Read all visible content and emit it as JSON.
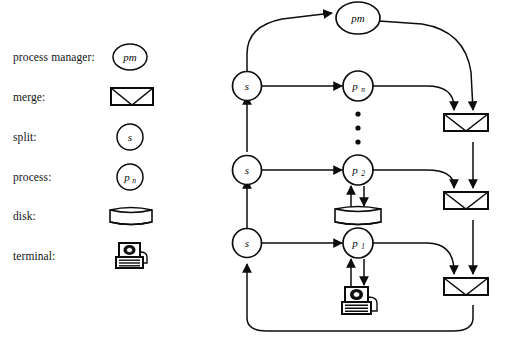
{
  "figure": {
    "kind": "process-pipeline-diagram",
    "background_color": "#ffffff",
    "line_color": "#0d0d0d"
  },
  "legend": {
    "title": "",
    "items": [
      {
        "label": "process manager:",
        "symbol": "pm-oval",
        "symbol_text": "pm",
        "y": 57
      },
      {
        "label": "merge:",
        "symbol": "merge-box",
        "symbol_text": "",
        "y": 97
      },
      {
        "label": "split:",
        "symbol": "split-circle",
        "symbol_text": "s",
        "y": 137
      },
      {
        "label": "process:",
        "symbol": "process-circle",
        "symbol_text": "p",
        "symbol_sub": "n",
        "y": 177
      },
      {
        "label": "disk:",
        "symbol": "disk-cylinder",
        "symbol_text": "",
        "y": 216
      },
      {
        "label": "terminal:",
        "symbol": "terminal-workstation",
        "symbol_text": "",
        "y": 256
      }
    ]
  },
  "diagram": {
    "nodes": [
      {
        "id": "pm",
        "type": "process-manager",
        "label": "pm",
        "sub": "",
        "x": 358,
        "y": 25
      },
      {
        "id": "s3",
        "type": "split",
        "label": "s",
        "sub": "",
        "x": 247,
        "y": 86
      },
      {
        "id": "pn",
        "type": "process",
        "label": "p",
        "sub": "n",
        "x": 358,
        "y": 86
      },
      {
        "id": "s2",
        "type": "split",
        "label": "s",
        "sub": "",
        "x": 247,
        "y": 170
      },
      {
        "id": "p2",
        "type": "process",
        "label": "p",
        "sub": "2",
        "x": 358,
        "y": 170
      },
      {
        "id": "s1",
        "type": "split",
        "label": "s",
        "sub": "",
        "x": 247,
        "y": 243
      },
      {
        "id": "p1",
        "type": "process",
        "label": "p",
        "sub": "1",
        "x": 358,
        "y": 243
      },
      {
        "id": "disk",
        "type": "disk",
        "label": "",
        "sub": "",
        "x": 358,
        "y": 215
      },
      {
        "id": "terminal",
        "type": "terminal",
        "label": "",
        "sub": "",
        "x": 358,
        "y": 300
      },
      {
        "id": "m3",
        "type": "merge",
        "label": "",
        "sub": "",
        "x": 473,
        "y": 127
      },
      {
        "id": "m2",
        "type": "merge",
        "label": "",
        "sub": "",
        "x": 473,
        "y": 205
      },
      {
        "id": "m1",
        "type": "merge",
        "label": "",
        "sub": "",
        "x": 473,
        "y": 291
      }
    ],
    "ellipsis": {
      "x": 358,
      "y": 131,
      "count": 3,
      "label": "vertical-ellipsis"
    },
    "edges": [
      {
        "from": "s3",
        "to": "pm",
        "style": "curve"
      },
      {
        "from": "s3",
        "to": "pn",
        "style": "straight"
      },
      {
        "from": "pm",
        "to": "m3",
        "style": "curve"
      },
      {
        "from": "pn",
        "to": "m3",
        "style": "curve"
      },
      {
        "from": "s2",
        "to": "p2",
        "style": "straight"
      },
      {
        "from": "p2",
        "to": "m2",
        "style": "curve"
      },
      {
        "from": "m3",
        "to": "m2",
        "style": "straight"
      },
      {
        "from": "s1",
        "to": "p1",
        "style": "straight"
      },
      {
        "from": "p1",
        "to": "m1",
        "style": "curve"
      },
      {
        "from": "m2",
        "to": "m1",
        "style": "straight"
      },
      {
        "from": "p2",
        "to": "disk",
        "style": "straight"
      },
      {
        "from": "disk",
        "to": "p2",
        "style": "straight"
      },
      {
        "from": "p1",
        "to": "terminal",
        "style": "straight"
      },
      {
        "from": "terminal",
        "to": "p1",
        "style": "straight"
      },
      {
        "from": "s1",
        "to": "s2",
        "style": "straight"
      },
      {
        "from": "s2",
        "to": "s3",
        "style": "straight"
      },
      {
        "from": "m1",
        "to": "s1",
        "style": "loop-bottom"
      }
    ]
  }
}
